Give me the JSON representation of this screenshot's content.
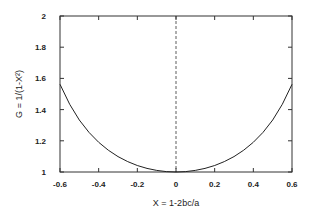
{
  "chart_data": {
    "type": "line",
    "title": "",
    "xlabel": "X = 1-2bc/a",
    "ylabel": "G = 1/(1-X²)",
    "xlim": [
      -0.6,
      0.6
    ],
    "ylim": [
      1,
      2
    ],
    "grid": false,
    "legend": null,
    "x_ticks": [
      "-0.6",
      "-0.4",
      "-0.2",
      "0",
      "0.2",
      "0.4",
      "0.6"
    ],
    "y_ticks": [
      "1",
      "1.2",
      "1.4",
      "1.6",
      "1.8",
      "2"
    ],
    "reference_lines": [
      {
        "type": "vertical",
        "x": 0,
        "style": "dashed"
      }
    ],
    "series": [
      {
        "name": "G = 1/(1-X^2)",
        "x": [
          -0.6,
          -0.55,
          -0.5,
          -0.45,
          -0.4,
          -0.35,
          -0.3,
          -0.25,
          -0.2,
          -0.15,
          -0.1,
          -0.05,
          0,
          0.05,
          0.1,
          0.15,
          0.2,
          0.25,
          0.3,
          0.35,
          0.4,
          0.45,
          0.5,
          0.55,
          0.6
        ],
        "values": [
          1.5625,
          1.4337,
          1.3333,
          1.2539,
          1.1905,
          1.1396,
          1.0989,
          1.0667,
          1.0417,
          1.023,
          1.0101,
          1.0025,
          1.0,
          1.0025,
          1.0101,
          1.023,
          1.0417,
          1.0667,
          1.0989,
          1.1396,
          1.1905,
          1.2539,
          1.3333,
          1.4337,
          1.5625
        ]
      }
    ]
  }
}
